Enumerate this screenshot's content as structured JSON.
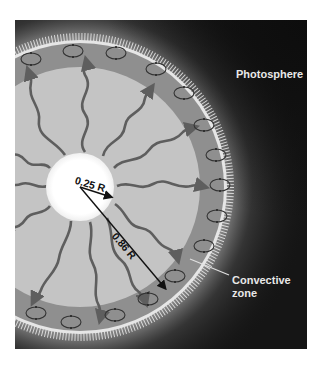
{
  "figure": {
    "labels": {
      "photosphere": "Photosphere",
      "convective_zone_line1": "Convective",
      "convective_zone_line2": "zone",
      "core_radius": "0.25 R",
      "radiative_radius": "0.86 R"
    },
    "colors": {
      "background": "#151515",
      "corona_glow": "#d8d8d8",
      "convective_zone": "#8f8f8f",
      "radiative_zone": "#c4c4c4",
      "core": "#ffffff",
      "arrows": "#5e5e5e",
      "cells": "#333333",
      "label_text": "#e8e8e8"
    },
    "geometry": {
      "core_fraction": 0.25,
      "radiative_outer_fraction": 0.86
    },
    "convection_cell_count": 16,
    "energy_arrow_count": 12
  }
}
